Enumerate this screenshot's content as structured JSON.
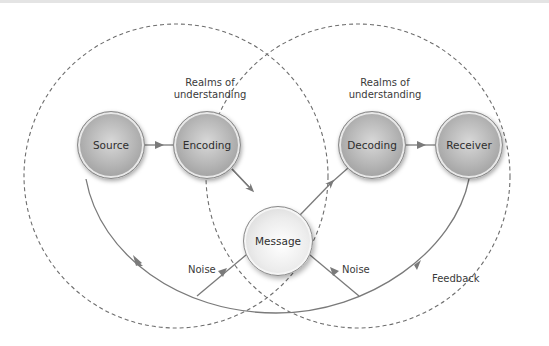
{
  "diagram": {
    "realms": [
      {
        "label_line1": "Realms of",
        "label_line2": "understanding"
      },
      {
        "label_line1": "Realms of",
        "label_line2": "understanding"
      }
    ],
    "nodes": {
      "source": "Source",
      "encoding": "Encoding",
      "message": "Message",
      "decoding": "Decoding",
      "receiver": "Receiver"
    },
    "labels": {
      "noise_left": "Noise",
      "noise_right": "Noise",
      "feedback": "Feedback"
    },
    "colors": {
      "line": "#7a7a7a",
      "dashed": "#6e6e6e",
      "node_dark": "#a8a8a8",
      "node_light": "#eeeeee",
      "text": "#333333"
    }
  }
}
